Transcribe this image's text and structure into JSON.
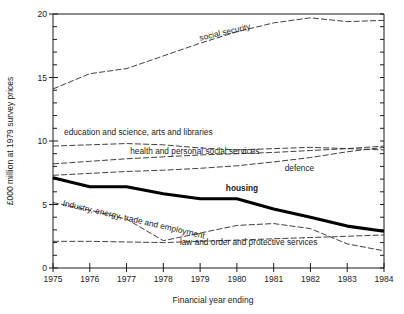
{
  "chart_data": {
    "type": "line",
    "title": "",
    "xlabel": "Financial year ending",
    "ylabel": "£000 million at 1979 survey prices",
    "x": [
      1975,
      1976,
      1977,
      1978,
      1979,
      1980,
      1981,
      1982,
      1983,
      1984
    ],
    "xlim": [
      1975,
      1984
    ],
    "ylim": [
      0,
      20
    ],
    "y_major_ticks": [
      0,
      5,
      10,
      15,
      20
    ],
    "y_major_tick_labels": [
      "0",
      "5",
      "10",
      "15",
      "20"
    ],
    "y_minor_tick_step": 1,
    "x_tick_labels": [
      "1975",
      "1976",
      "1977",
      "1978",
      "1979",
      "1980",
      "1981",
      "1982",
      "1983",
      "1984"
    ],
    "grid": false,
    "legend": "inline-labels",
    "series": [
      {
        "name": "social security",
        "label": "social security",
        "style": "dashed",
        "values": [
          14.1,
          15.3,
          15.7,
          16.7,
          17.7,
          18.6,
          19.3,
          19.7,
          19.4,
          19.5
        ],
        "label_x": 1979.0,
        "label_y": 17.9,
        "label_rotate": -13
      },
      {
        "name": "education and science, arts and libraries",
        "label": "education and science, arts and libraries",
        "style": "dashed",
        "values": [
          9.6,
          9.7,
          9.8,
          9.7,
          9.45,
          9.3,
          9.4,
          9.5,
          9.4,
          9.3
        ],
        "label_x": 1975.3,
        "label_y": 10.45,
        "label_rotate": 0
      },
      {
        "name": "health and personal social services",
        "label": "health and personal social services",
        "style": "dashed",
        "values": [
          8.2,
          8.4,
          8.6,
          8.75,
          8.9,
          9.0,
          9.1,
          9.25,
          9.4,
          9.6
        ],
        "label_x": 1977.1,
        "label_y": 8.95,
        "label_rotate": 0
      },
      {
        "name": "defence",
        "label": "defence",
        "style": "dashed",
        "values": [
          7.3,
          7.45,
          7.6,
          7.7,
          7.85,
          8.05,
          8.35,
          8.7,
          9.15,
          9.5
        ],
        "label_x": 1981.3,
        "label_y": 7.65,
        "label_rotate": 0
      },
      {
        "name": "housing",
        "label": "housing",
        "style": "solid-thick",
        "values": [
          7.1,
          6.4,
          6.4,
          5.85,
          5.45,
          5.45,
          4.65,
          4.0,
          3.3,
          2.9
        ],
        "label_x": 1979.7,
        "label_y": 6.05,
        "label_rotate": 0
      },
      {
        "name": "industry, energy, trade and employment",
        "label": "Industry, energy, trade and  employment",
        "style": "dashed",
        "values": [
          5.15,
          4.55,
          3.85,
          2.15,
          2.75,
          3.35,
          3.5,
          3.1,
          1.9,
          1.35
        ],
        "label_x": 1975.25,
        "label_y": 4.9,
        "label_rotate": 13
      },
      {
        "name": "law and order and protective services",
        "label": "law and order and protective services",
        "style": "dashed",
        "values": [
          2.1,
          2.1,
          2.05,
          2.0,
          2.1,
          2.2,
          2.3,
          2.4,
          2.5,
          2.6
        ],
        "label_x": 1978.45,
        "label_y": 1.85,
        "label_rotate": 0
      }
    ]
  },
  "colors": {
    "axis": "#1a1a1a",
    "line": "#2b2b2b",
    "highlight": "#000000",
    "background": "#ffffff"
  }
}
